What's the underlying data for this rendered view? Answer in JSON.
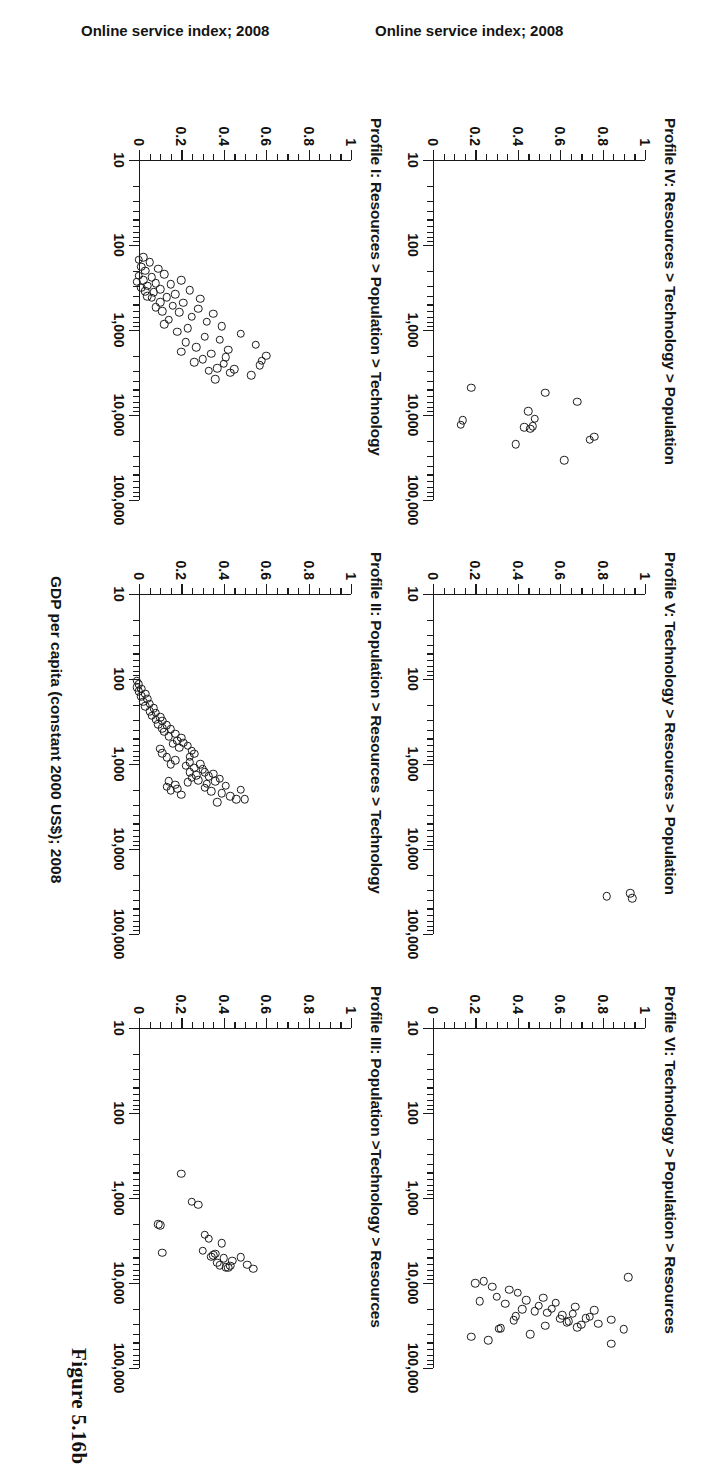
{
  "figure": {
    "caption": "Figure 5.16b",
    "x_axis_label": "GDP per capita (constant 2000 US$); 2008",
    "y_axis_label": "Online service index; 2008"
  },
  "chart_data": [
    {
      "type": "scatter",
      "panel_id": "profile-1",
      "title": "Profile I: Resources > Population > Technology",
      "xlabel": "GDP per capita (constant 2000 US$); 2008",
      "ylabel": "Online service index; 2008",
      "xscale": "log",
      "xlim": [
        10,
        100000
      ],
      "ylim": [
        0,
        1
      ],
      "xticks": [
        10,
        100,
        1000,
        10000,
        100000
      ],
      "xticklabels": [
        "10",
        "100",
        "1,000",
        "10,000",
        "100,000"
      ],
      "yticks": [
        0,
        0.2,
        0.4,
        0.6,
        0.8,
        1
      ],
      "yticklabels": [
        "0",
        "0.2",
        "0.4",
        "0.6",
        "0.8",
        "1"
      ],
      "points": [
        {
          "x": 2000,
          "y": 0.62
        },
        {
          "x": 2300,
          "y": 0.6
        },
        {
          "x": 2600,
          "y": 0.59
        },
        {
          "x": 1500,
          "y": 0.57
        },
        {
          "x": 3400,
          "y": 0.55
        },
        {
          "x": 1100,
          "y": 0.5
        },
        {
          "x": 2900,
          "y": 0.47
        },
        {
          "x": 3200,
          "y": 0.45
        },
        {
          "x": 1700,
          "y": 0.44
        },
        {
          "x": 2100,
          "y": 0.43
        },
        {
          "x": 2500,
          "y": 0.42
        },
        {
          "x": 900,
          "y": 0.41
        },
        {
          "x": 1300,
          "y": 0.4
        },
        {
          "x": 2800,
          "y": 0.39
        },
        {
          "x": 3800,
          "y": 0.38
        },
        {
          "x": 640,
          "y": 0.37
        },
        {
          "x": 1900,
          "y": 0.36
        },
        {
          "x": 3000,
          "y": 0.35
        },
        {
          "x": 800,
          "y": 0.34
        },
        {
          "x": 1200,
          "y": 0.33
        },
        {
          "x": 2200,
          "y": 0.32
        },
        {
          "x": 430,
          "y": 0.31
        },
        {
          "x": 560,
          "y": 0.3
        },
        {
          "x": 1600,
          "y": 0.29
        },
        {
          "x": 2400,
          "y": 0.28
        },
        {
          "x": 700,
          "y": 0.27
        },
        {
          "x": 340,
          "y": 0.26
        },
        {
          "x": 950,
          "y": 0.25
        },
        {
          "x": 1400,
          "y": 0.24
        },
        {
          "x": 480,
          "y": 0.23
        },
        {
          "x": 260,
          "y": 0.22
        },
        {
          "x": 620,
          "y": 0.21
        },
        {
          "x": 1050,
          "y": 0.2
        },
        {
          "x": 380,
          "y": 0.19
        },
        {
          "x": 520,
          "y": 0.18
        },
        {
          "x": 290,
          "y": 0.17
        },
        {
          "x": 760,
          "y": 0.16
        },
        {
          "x": 410,
          "y": 0.15
        },
        {
          "x": 220,
          "y": 0.14
        },
        {
          "x": 600,
          "y": 0.13
        },
        {
          "x": 330,
          "y": 0.12
        },
        {
          "x": 470,
          "y": 0.12
        },
        {
          "x": 190,
          "y": 0.11
        },
        {
          "x": 280,
          "y": 0.1
        },
        {
          "x": 540,
          "y": 0.1
        },
        {
          "x": 360,
          "y": 0.09
        },
        {
          "x": 240,
          "y": 0.08
        },
        {
          "x": 420,
          "y": 0.08
        },
        {
          "x": 160,
          "y": 0.07
        },
        {
          "x": 300,
          "y": 0.06
        },
        {
          "x": 200,
          "y": 0.05
        },
        {
          "x": 350,
          "y": 0.05
        },
        {
          "x": 140,
          "y": 0.04
        },
        {
          "x": 260,
          "y": 0.04
        },
        {
          "x": 180,
          "y": 0.03
        },
        {
          "x": 320,
          "y": 0.03
        },
        {
          "x": 230,
          "y": 0.02
        },
        {
          "x": 150,
          "y": 0.02
        },
        {
          "x": 270,
          "y": 0.01
        },
        {
          "x": 400,
          "y": 0.06
        },
        {
          "x": 850,
          "y": 0.14
        },
        {
          "x": 1800,
          "y": 0.22
        }
      ]
    },
    {
      "type": "scatter",
      "panel_id": "profile-2",
      "title": "Profile II: Population > Resources > Technology",
      "xlabel": "GDP per capita (constant 2000 US$); 2008",
      "ylabel": "",
      "xscale": "log",
      "xlim": [
        10,
        100000
      ],
      "ylim": [
        0,
        1
      ],
      "xticks": [
        10,
        100,
        1000,
        10000,
        100000
      ],
      "xticklabels": [
        "10",
        "100",
        "1,000",
        "10,000",
        "100,000"
      ],
      "yticks": [
        0,
        0.2,
        0.4,
        0.6,
        0.8,
        1
      ],
      "points": [
        {
          "x": 2600,
          "y": 0.52
        },
        {
          "x": 2600,
          "y": 0.48
        },
        {
          "x": 2000,
          "y": 0.5
        },
        {
          "x": 2400,
          "y": 0.45
        },
        {
          "x": 1800,
          "y": 0.43
        },
        {
          "x": 2200,
          "y": 0.41
        },
        {
          "x": 1500,
          "y": 0.4
        },
        {
          "x": 2800,
          "y": 0.39
        },
        {
          "x": 1600,
          "y": 0.38
        },
        {
          "x": 1300,
          "y": 0.37
        },
        {
          "x": 2100,
          "y": 0.36
        },
        {
          "x": 1400,
          "y": 0.35
        },
        {
          "x": 1700,
          "y": 0.34
        },
        {
          "x": 1250,
          "y": 0.33
        },
        {
          "x": 1900,
          "y": 0.33
        },
        {
          "x": 1150,
          "y": 0.32
        },
        {
          "x": 1000,
          "y": 0.31
        },
        {
          "x": 1550,
          "y": 0.3
        },
        {
          "x": 1350,
          "y": 0.29
        },
        {
          "x": 1100,
          "y": 0.28
        },
        {
          "x": 1450,
          "y": 0.27
        },
        {
          "x": 950,
          "y": 0.26
        },
        {
          "x": 1250,
          "y": 0.26
        },
        {
          "x": 1650,
          "y": 0.25
        },
        {
          "x": 1050,
          "y": 0.24
        },
        {
          "x": 760,
          "y": 0.28
        },
        {
          "x": 700,
          "y": 0.27
        },
        {
          "x": 820,
          "y": 0.26
        },
        {
          "x": 610,
          "y": 0.25
        },
        {
          "x": 560,
          "y": 0.23
        },
        {
          "x": 490,
          "y": 0.22
        },
        {
          "x": 640,
          "y": 0.21
        },
        {
          "x": 530,
          "y": 0.2
        },
        {
          "x": 440,
          "y": 0.19
        },
        {
          "x": 580,
          "y": 0.18
        },
        {
          "x": 390,
          "y": 0.17
        },
        {
          "x": 470,
          "y": 0.16
        },
        {
          "x": 350,
          "y": 0.15
        },
        {
          "x": 420,
          "y": 0.14
        },
        {
          "x": 310,
          "y": 0.13
        },
        {
          "x": 380,
          "y": 0.13
        },
        {
          "x": 280,
          "y": 0.12
        },
        {
          "x": 340,
          "y": 0.11
        },
        {
          "x": 250,
          "y": 0.1
        },
        {
          "x": 300,
          "y": 0.1
        },
        {
          "x": 220,
          "y": 0.09
        },
        {
          "x": 270,
          "y": 0.08
        },
        {
          "x": 195,
          "y": 0.07
        },
        {
          "x": 240,
          "y": 0.07
        },
        {
          "x": 170,
          "y": 0.06
        },
        {
          "x": 210,
          "y": 0.05
        },
        {
          "x": 150,
          "y": 0.05
        },
        {
          "x": 185,
          "y": 0.04
        },
        {
          "x": 130,
          "y": 0.03
        },
        {
          "x": 160,
          "y": 0.03
        },
        {
          "x": 115,
          "y": 0.02
        },
        {
          "x": 140,
          "y": 0.02
        },
        {
          "x": 105,
          "y": 0.01
        },
        {
          "x": 125,
          "y": 0.01
        },
        {
          "x": 1950,
          "y": 0.2
        },
        {
          "x": 2300,
          "y": 0.22
        },
        {
          "x": 1750,
          "y": 0.19
        },
        {
          "x": 2050,
          "y": 0.17
        },
        {
          "x": 1600,
          "y": 0.16
        },
        {
          "x": 1850,
          "y": 0.15
        },
        {
          "x": 900,
          "y": 0.19
        },
        {
          "x": 1000,
          "y": 0.17
        },
        {
          "x": 830,
          "y": 0.15
        },
        {
          "x": 750,
          "y": 0.13
        },
        {
          "x": 660,
          "y": 0.12
        }
      ]
    },
    {
      "type": "scatter",
      "panel_id": "profile-3",
      "title": "Profile III: Population >Technology > Resources",
      "xlabel": "",
      "ylabel": "",
      "xscale": "log",
      "xlim": [
        10,
        100000
      ],
      "ylim": [
        0,
        1
      ],
      "xticks": [
        10,
        100,
        1000,
        10000,
        100000
      ],
      "xticklabels": [
        "10",
        "100",
        "1,000",
        "10,000",
        "100,000"
      ],
      "yticks": [
        0,
        0.2,
        0.4,
        0.6,
        0.8,
        1
      ],
      "points": [
        {
          "x": 6800,
          "y": 0.56
        },
        {
          "x": 6100,
          "y": 0.53
        },
        {
          "x": 5000,
          "y": 0.5
        },
        {
          "x": 5500,
          "y": 0.46
        },
        {
          "x": 6300,
          "y": 0.45
        },
        {
          "x": 6600,
          "y": 0.44
        },
        {
          "x": 6500,
          "y": 0.43
        },
        {
          "x": 5100,
          "y": 0.42
        },
        {
          "x": 3400,
          "y": 0.41
        },
        {
          "x": 6200,
          "y": 0.4
        },
        {
          "x": 5800,
          "y": 0.39
        },
        {
          "x": 4500,
          "y": 0.38
        },
        {
          "x": 4700,
          "y": 0.37
        },
        {
          "x": 4900,
          "y": 0.36
        },
        {
          "x": 3000,
          "y": 0.35
        },
        {
          "x": 2700,
          "y": 0.33
        },
        {
          "x": 4200,
          "y": 0.32
        },
        {
          "x": 1200,
          "y": 0.3
        },
        {
          "x": 1100,
          "y": 0.27
        },
        {
          "x": 4400,
          "y": 0.13
        },
        {
          "x": 2100,
          "y": 0.12
        },
        {
          "x": 2050,
          "y": 0.11
        },
        {
          "x": 520,
          "y": 0.22
        }
      ]
    },
    {
      "type": "scatter",
      "panel_id": "profile-4",
      "title": "Profile IV: Resources > Technology > Population",
      "xlabel": "",
      "ylabel": "Online service index; 2008",
      "xscale": "log",
      "xlim": [
        10,
        100000
      ],
      "ylim": [
        0,
        1
      ],
      "xticks": [
        10,
        100,
        1000,
        10000,
        100000
      ],
      "xticklabels": [
        "10",
        "100",
        "1,000",
        "10,000",
        "100,000"
      ],
      "yticks": [
        0,
        0.2,
        0.4,
        0.6,
        0.8,
        1
      ],
      "points": [
        {
          "x": 18000,
          "y": 0.78
        },
        {
          "x": 19500,
          "y": 0.76
        },
        {
          "x": 7000,
          "y": 0.7
        },
        {
          "x": 34000,
          "y": 0.64
        },
        {
          "x": 5500,
          "y": 0.55
        },
        {
          "x": 11000,
          "y": 0.5
        },
        {
          "x": 13500,
          "y": 0.49
        },
        {
          "x": 14500,
          "y": 0.48
        },
        {
          "x": 9000,
          "y": 0.47
        },
        {
          "x": 14000,
          "y": 0.45
        },
        {
          "x": 22000,
          "y": 0.41
        },
        {
          "x": 4800,
          "y": 0.2
        },
        {
          "x": 11500,
          "y": 0.16
        },
        {
          "x": 13000,
          "y": 0.15
        }
      ]
    },
    {
      "type": "scatter",
      "panel_id": "profile-5",
      "title": "Profile V: Technology > Resources > Population",
      "xlabel": "",
      "ylabel": "",
      "xscale": "log",
      "xlim": [
        10,
        100000
      ],
      "ylim": [
        0,
        1
      ],
      "xticks": [
        10,
        100,
        1000,
        10000,
        100000
      ],
      "xticklabels": [
        "10",
        "100",
        "1,000",
        "10,000",
        "100,000"
      ],
      "yticks": [
        0,
        0.2,
        0.4,
        0.6,
        0.8,
        1
      ],
      "points": [
        {
          "x": 38000,
          "y": 0.96
        },
        {
          "x": 33000,
          "y": 0.95
        },
        {
          "x": 36000,
          "y": 0.84
        }
      ]
    },
    {
      "type": "scatter",
      "panel_id": "profile-6",
      "title": "Profile VI: Technology > Population > Resources",
      "xlabel": "",
      "ylabel": "",
      "xscale": "log",
      "xlim": [
        10,
        100000
      ],
      "ylim": [
        0,
        1
      ],
      "xticks": [
        10,
        100,
        1000,
        10000,
        100000
      ],
      "xticklabels": [
        "10",
        "100",
        "1,000",
        "10,000",
        "100,000"
      ],
      "yticks": [
        0,
        0.2,
        0.4,
        0.6,
        0.8,
        1
      ],
      "points": [
        {
          "x": 35000,
          "y": 0.92
        },
        {
          "x": 27000,
          "y": 0.86
        },
        {
          "x": 30000,
          "y": 0.8
        },
        {
          "x": 21000,
          "y": 0.78
        },
        {
          "x": 25000,
          "y": 0.76
        },
        {
          "x": 26000,
          "y": 0.74
        },
        {
          "x": 31000,
          "y": 0.72
        },
        {
          "x": 33000,
          "y": 0.7
        },
        {
          "x": 19000,
          "y": 0.69
        },
        {
          "x": 23000,
          "y": 0.68
        },
        {
          "x": 28000,
          "y": 0.66
        },
        {
          "x": 29000,
          "y": 0.65
        },
        {
          "x": 24000,
          "y": 0.63
        },
        {
          "x": 26500,
          "y": 0.62
        },
        {
          "x": 17000,
          "y": 0.6
        },
        {
          "x": 20000,
          "y": 0.58
        },
        {
          "x": 22500,
          "y": 0.56
        },
        {
          "x": 32000,
          "y": 0.55
        },
        {
          "x": 15000,
          "y": 0.54
        },
        {
          "x": 18500,
          "y": 0.52
        },
        {
          "x": 21500,
          "y": 0.5
        },
        {
          "x": 40000,
          "y": 0.48
        },
        {
          "x": 16000,
          "y": 0.46
        },
        {
          "x": 20500,
          "y": 0.44
        },
        {
          "x": 13000,
          "y": 0.42
        },
        {
          "x": 24500,
          "y": 0.41
        },
        {
          "x": 27500,
          "y": 0.4
        },
        {
          "x": 12000,
          "y": 0.38
        },
        {
          "x": 17500,
          "y": 0.36
        },
        {
          "x": 34000,
          "y": 0.34
        },
        {
          "x": 34500,
          "y": 0.33
        },
        {
          "x": 14500,
          "y": 0.32
        },
        {
          "x": 11000,
          "y": 0.3
        },
        {
          "x": 47000,
          "y": 0.28
        },
        {
          "x": 9500,
          "y": 0.26
        },
        {
          "x": 16500,
          "y": 0.24
        },
        {
          "x": 10000,
          "y": 0.22
        },
        {
          "x": 43000,
          "y": 0.2
        },
        {
          "x": 8500,
          "y": 0.94
        },
        {
          "x": 52000,
          "y": 0.86
        }
      ]
    }
  ],
  "panels": [
    {
      "id": "profile-6",
      "title": "Profile VI: Technology > Population > Resources"
    },
    {
      "id": "profile-5",
      "title": "Profile V: Technology > Resources > Population"
    },
    {
      "id": "profile-4",
      "title": "Profile IV: Resources > Technology > Population"
    },
    {
      "id": "profile-3",
      "title": "Profile III: Population >Technology > Resources"
    },
    {
      "id": "profile-2",
      "title": "Profile II: Population > Resources > Technology"
    },
    {
      "id": "profile-1",
      "title": "Profile I: Resources > Population > Technology"
    }
  ]
}
